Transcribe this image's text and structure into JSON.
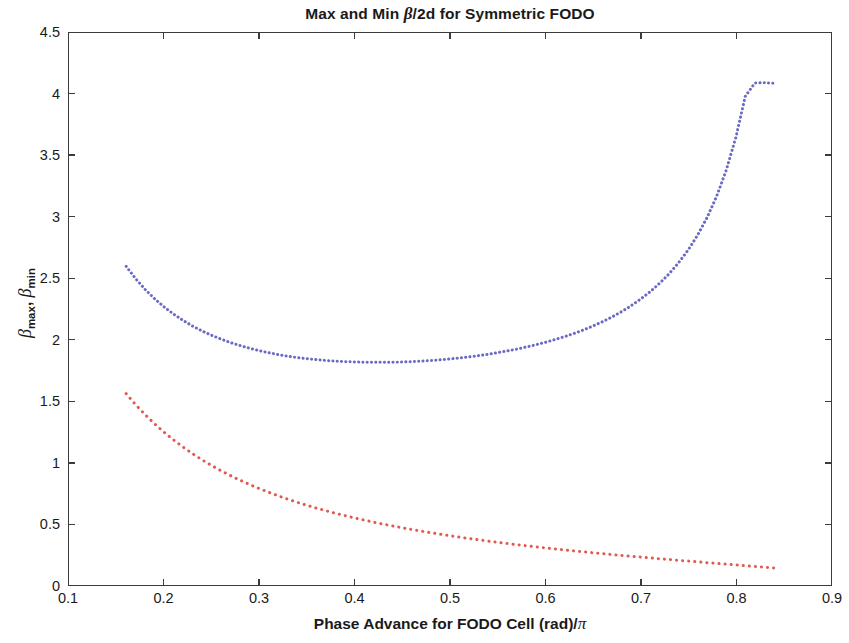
{
  "chart_data": {
    "type": "line",
    "title": "Max and Min β/2d for Symmetric FODO",
    "title_parts": {
      "before": "Max and Min ",
      "beta": "β",
      "after": "/2d for Symmetric FODO"
    },
    "xlabel": "Phase Advance for FODO Cell (rad)/π",
    "xlabel_parts": {
      "before": "Phase Advance for FODO Cell (rad)/",
      "pi": "π"
    },
    "ylabel": "βmax, βmin",
    "ylabel_parts": {
      "beta1": "β",
      "sub1": "max",
      "sep": ", ",
      "beta2": "β",
      "sub2": "min"
    },
    "xlim": [
      0.1,
      0.9
    ],
    "ylim": [
      0,
      4.5
    ],
    "xticks": [
      "0.1",
      "0.2",
      "0.3",
      "0.4",
      "0.5",
      "0.6",
      "0.7",
      "0.8",
      "0.9"
    ],
    "xtick_values": [
      0.1,
      0.2,
      0.3,
      0.4,
      0.5,
      0.6,
      0.7,
      0.8,
      0.9
    ],
    "yticks": [
      "0",
      "0.5",
      "1",
      "1.5",
      "2",
      "2.5",
      "3",
      "3.5",
      "4",
      "4.5"
    ],
    "ytick_values": [
      0,
      0.5,
      1,
      1.5,
      2,
      2.5,
      3,
      3.5,
      4,
      4.5
    ],
    "grid": false,
    "legend": null,
    "box": true,
    "series": [
      {
        "name": "beta_max",
        "color": "#6a6ac4",
        "style": "dotted-dense",
        "linewidth": 3,
        "x": [
          0.16,
          0.17,
          0.18,
          0.19,
          0.2,
          0.21,
          0.22,
          0.23,
          0.24,
          0.25,
          0.26,
          0.27,
          0.28,
          0.29,
          0.3,
          0.31,
          0.32,
          0.33,
          0.34,
          0.35,
          0.36,
          0.37,
          0.38,
          0.39,
          0.4,
          0.41,
          0.42,
          0.43,
          0.44,
          0.45,
          0.46,
          0.47,
          0.48,
          0.49,
          0.5,
          0.51,
          0.52,
          0.53,
          0.54,
          0.55,
          0.56,
          0.57,
          0.58,
          0.59,
          0.6,
          0.61,
          0.62,
          0.63,
          0.64,
          0.65,
          0.66,
          0.67,
          0.68,
          0.69,
          0.7,
          0.71,
          0.72,
          0.73,
          0.74,
          0.75,
          0.76,
          0.77,
          0.78,
          0.79,
          0.8,
          0.81,
          0.82,
          0.83,
          0.84
        ],
        "y": [
          2.598,
          2.497,
          2.409,
          2.333,
          2.266,
          2.207,
          2.156,
          2.11,
          2.07,
          2.035,
          2.003,
          1.975,
          1.951,
          1.929,
          1.91,
          1.893,
          1.878,
          1.865,
          1.854,
          1.845,
          1.837,
          1.83,
          1.825,
          1.821,
          1.818,
          1.816,
          1.815,
          1.815,
          1.816,
          1.818,
          1.821,
          1.825,
          1.83,
          1.836,
          1.843,
          1.851,
          1.86,
          1.87,
          1.881,
          1.894,
          1.908,
          1.923,
          1.94,
          1.958,
          1.978,
          2.0,
          2.024,
          2.05,
          2.079,
          2.111,
          2.146,
          2.185,
          2.228,
          2.276,
          2.33,
          2.39,
          2.459,
          2.537,
          2.627,
          2.731,
          2.853,
          2.997,
          3.17,
          3.381,
          3.645,
          3.984,
          4.092,
          4.095,
          4.09
        ]
      },
      {
        "name": "beta_min",
        "color": "#e2584c",
        "style": "dotted",
        "linewidth": 3,
        "x": [
          0.16,
          0.17,
          0.18,
          0.19,
          0.2,
          0.21,
          0.22,
          0.23,
          0.24,
          0.25,
          0.26,
          0.27,
          0.28,
          0.29,
          0.3,
          0.31,
          0.32,
          0.33,
          0.34,
          0.35,
          0.36,
          0.37,
          0.38,
          0.39,
          0.4,
          0.41,
          0.42,
          0.43,
          0.44,
          0.45,
          0.46,
          0.47,
          0.48,
          0.49,
          0.5,
          0.51,
          0.52,
          0.53,
          0.54,
          0.55,
          0.56,
          0.57,
          0.58,
          0.59,
          0.6,
          0.61,
          0.62,
          0.63,
          0.64,
          0.65,
          0.66,
          0.67,
          0.68,
          0.69,
          0.7,
          0.71,
          0.72,
          0.73,
          0.74,
          0.75,
          0.76,
          0.77,
          0.78,
          0.79,
          0.8,
          0.81,
          0.82,
          0.83,
          0.84
        ],
        "y": [
          1.56,
          1.47,
          1.388,
          1.313,
          1.244,
          1.181,
          1.123,
          1.069,
          1.019,
          0.973,
          0.93,
          0.89,
          0.853,
          0.818,
          0.785,
          0.755,
          0.726,
          0.699,
          0.673,
          0.649,
          0.626,
          0.605,
          0.584,
          0.565,
          0.546,
          0.529,
          0.512,
          0.496,
          0.481,
          0.466,
          0.452,
          0.439,
          0.426,
          0.414,
          0.402,
          0.39,
          0.379,
          0.369,
          0.358,
          0.348,
          0.339,
          0.329,
          0.32,
          0.311,
          0.303,
          0.294,
          0.286,
          0.278,
          0.271,
          0.263,
          0.256,
          0.248,
          0.241,
          0.234,
          0.228,
          0.221,
          0.214,
          0.208,
          0.201,
          0.195,
          0.189,
          0.182,
          0.176,
          0.17,
          0.164,
          0.157,
          0.151,
          0.145,
          0.139
        ]
      }
    ],
    "annotations": []
  },
  "colors": {
    "axis": "#3b3b3b",
    "text": "#1a1a1a",
    "background": "#ffffff",
    "series_max": "#6a6ac4",
    "series_min": "#e2584c"
  }
}
